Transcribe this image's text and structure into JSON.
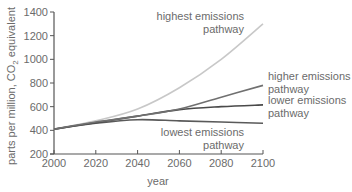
{
  "chart_data": {
    "type": "line",
    "title": "",
    "xlabel": "year",
    "ylabel": "parts per million, CO2 equivalent",
    "ylabel_parts": [
      "parts per million, CO",
      "2",
      " equivalent"
    ],
    "xlim": [
      2000,
      2100
    ],
    "ylim": [
      200,
      1400
    ],
    "x_ticks": [
      2000,
      2020,
      2040,
      2060,
      2080,
      2100
    ],
    "y_ticks": [
      200,
      400,
      600,
      800,
      1000,
      1200,
      1400
    ],
    "grid": false,
    "legend": "inline labels at right",
    "x": [
      2000,
      2020,
      2040,
      2060,
      2080,
      2100
    ],
    "series": [
      {
        "name": "highest emissions pathway",
        "label_lines": [
          "highest emissions",
          "pathway"
        ],
        "color": "#c8c8c8",
        "values": [
          410,
          480,
          580,
          760,
          1000,
          1300
        ]
      },
      {
        "name": "higher emissions pathway",
        "label_lines": [
          "higher emissions",
          "pathway"
        ],
        "color": "#707070",
        "values": [
          410,
          470,
          520,
          580,
          680,
          780
        ]
      },
      {
        "name": "lower emissions pathway",
        "label_lines": [
          "lower emissions",
          "pathway"
        ],
        "color": "#4a4a4a",
        "values": [
          410,
          465,
          520,
          575,
          600,
          615
        ]
      },
      {
        "name": "lowest emissions pathway",
        "label_lines": [
          "lowest emissions",
          "pathway"
        ],
        "color": "#5a5a5a",
        "values": [
          410,
          460,
          490,
          480,
          470,
          460
        ]
      }
    ]
  },
  "colors": {
    "axis": "#555555",
    "text": "#6b6b6b"
  }
}
